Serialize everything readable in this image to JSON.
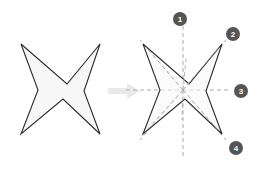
{
  "figure": {
    "canvas": {
      "width": 265,
      "height": 188,
      "background": "#ffffff"
    },
    "colors": {
      "star_fill": "#f7f7f7",
      "star_stroke": "#2b2b2b",
      "dashed_axis": "#a9a9a9",
      "badge_fill": "#555555",
      "badge_text": "#ffffff",
      "arrow": "#e9e9e9"
    },
    "shapes": {
      "left_star": {
        "name": "four-pointed-star-plain",
        "center": [
          61,
          90
        ],
        "points": 4,
        "outer_tips": [
          [
            21,
            44
          ],
          [
            100,
            44
          ],
          [
            100,
            134
          ],
          [
            21,
            134
          ]
        ],
        "inner_vertices": [
          [
            67,
            84
          ],
          [
            58,
            82
          ],
          [
            55,
            96
          ],
          [
            65,
            98
          ]
        ]
      },
      "right_star": {
        "name": "four-pointed-star-with-axes",
        "center": [
          183,
          90
        ],
        "points": 4,
        "outer_tips": [
          [
            143,
            44
          ],
          [
            222,
            44
          ],
          [
            222,
            134
          ],
          [
            143,
            134
          ]
        ],
        "inner_vertices": [
          [
            189,
            84
          ],
          [
            180,
            82
          ],
          [
            177,
            96
          ],
          [
            187,
            98
          ]
        ]
      },
      "arrow": {
        "name": "transform-arrow",
        "direction": "right",
        "from": [
          108,
          91
        ],
        "to": [
          137,
          91
        ]
      }
    },
    "axes": {
      "label": "symmetry axes",
      "style": "dashed",
      "count": 8,
      "description": "dashed lines radiating from the star center"
    },
    "badges": [
      {
        "id": 1,
        "label": "1",
        "position": [
          180,
          19
        ],
        "axis": "vertical-up"
      },
      {
        "id": 2,
        "label": "2",
        "position": [
          233,
          34
        ],
        "axis": "diagonal-up-right"
      },
      {
        "id": 3,
        "label": "3",
        "position": [
          241,
          91
        ],
        "axis": "horizontal-right"
      },
      {
        "id": 4,
        "label": "4",
        "position": [
          236,
          148
        ],
        "axis": "diagonal-down-right"
      }
    ]
  }
}
